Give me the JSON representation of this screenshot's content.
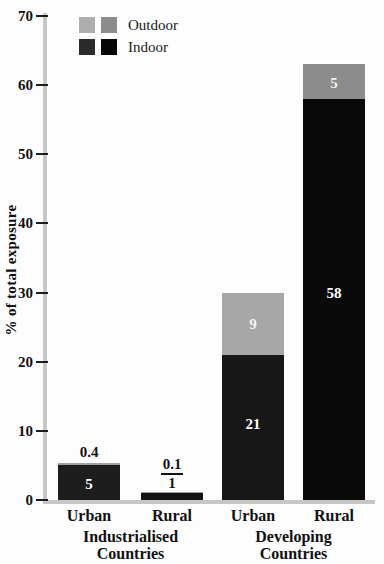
{
  "chart_data": {
    "type": "bar",
    "stacked": true,
    "title": "",
    "ylabel": "% of total exposure",
    "xlabel": "",
    "ylim": [
      0,
      70
    ],
    "yticks": [
      0,
      10,
      20,
      30,
      40,
      50,
      60,
      70
    ],
    "grid": false,
    "legend": {
      "position": "top-left",
      "entries": [
        {
          "name": "Outdoor",
          "swatches": [
            "#aeaeae",
            "#8d8d8d"
          ]
        },
        {
          "name": "Indoor",
          "swatches": [
            "#2b2b2b",
            "#070707"
          ]
        }
      ]
    },
    "categories": [
      "Urban",
      "Rural",
      "Urban",
      "Rural"
    ],
    "series": [
      {
        "name": "Indoor",
        "values": [
          5,
          1,
          21,
          58
        ]
      },
      {
        "name": "Outdoor",
        "values": [
          0.4,
          0.1,
          9,
          5
        ]
      }
    ],
    "groups": [
      {
        "label_lines": [
          "Industrialised",
          "Countries"
        ],
        "bars": [
          {
            "category": "Urban",
            "indoor": 5,
            "outdoor": 0.4,
            "indoor_color": "#1d1d1d",
            "outdoor_color": "#9f9f9f",
            "labels": [
              {
                "text": "5",
                "color": "#ffffff",
                "at_value": 2.3
              },
              {
                "text": "0.4",
                "color": "#111111",
                "placement": "above"
              }
            ]
          },
          {
            "category": "Rural",
            "indoor": 1,
            "outdoor": 0.1,
            "indoor_color": "#121212",
            "outdoor_color": "#9f9f9f",
            "above_fraction": {
              "numerator": "0.1",
              "denominator": "1"
            }
          }
        ]
      },
      {
        "label_lines": [
          "Developing",
          "Countries"
        ],
        "bars": [
          {
            "category": "Urban",
            "indoor": 21,
            "outdoor": 9,
            "indoor_color": "#171717",
            "outdoor_color": "#a7a7a7",
            "labels": [
              {
                "text": "21",
                "color": "#ffffff",
                "at_value": 11
              },
              {
                "text": "9",
                "color": "#f4f4f4",
                "at_value": 25.4
              }
            ]
          },
          {
            "category": "Rural",
            "indoor": 58,
            "outdoor": 5,
            "indoor_color": "#0a0a0a",
            "outdoor_color": "#8c8c8c",
            "labels": [
              {
                "text": "58",
                "color": "#ffffff",
                "at_value": 30
              },
              {
                "text": "5",
                "color": "#f2f2f2",
                "at_value": 60.3
              }
            ]
          }
        ]
      }
    ]
  }
}
